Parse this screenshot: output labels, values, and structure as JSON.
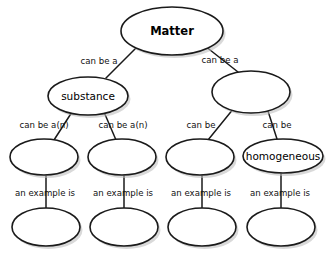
{
  "diagram": {
    "colors": {
      "background": "#ffffff",
      "node_fill": "#ffffff",
      "node_stroke": "#1a1a1a",
      "shadow": "#b9b9b9",
      "text": "#000000"
    },
    "nodes": [
      {
        "id": "matter",
        "label": "Matter",
        "cx": 172,
        "cy": 31,
        "rx": 51,
        "ry": 24,
        "bold": true
      },
      {
        "id": "substance",
        "label": "substance",
        "cx": 88,
        "cy": 96,
        "rx": 40,
        "ry": 19,
        "bold": false
      },
      {
        "id": "mixture",
        "label": "",
        "cx": 251,
        "cy": 92,
        "rx": 39,
        "ry": 21,
        "bold": false
      },
      {
        "id": "element",
        "label": "",
        "cx": 44,
        "cy": 157,
        "rx": 34,
        "ry": 18,
        "bold": false
      },
      {
        "id": "compound",
        "label": "",
        "cx": 122,
        "cy": 157,
        "rx": 34,
        "ry": 18,
        "bold": false
      },
      {
        "id": "heterog",
        "label": "",
        "cx": 200,
        "cy": 157,
        "rx": 34,
        "ry": 18,
        "bold": false
      },
      {
        "id": "homogeneous",
        "label": "homogeneous",
        "cx": 283,
        "cy": 156,
        "rx": 40,
        "ry": 17,
        "bold": false
      },
      {
        "id": "ex1",
        "label": "",
        "cx": 46,
        "cy": 227,
        "rx": 34,
        "ry": 19,
        "bold": false
      },
      {
        "id": "ex2",
        "label": "",
        "cx": 124,
        "cy": 227,
        "rx": 34,
        "ry": 19,
        "bold": false
      },
      {
        "id": "ex3",
        "label": "",
        "cx": 202,
        "cy": 227,
        "rx": 34,
        "ry": 19,
        "bold": false
      },
      {
        "id": "ex4",
        "label": "",
        "cx": 281,
        "cy": 227,
        "rx": 34,
        "ry": 19,
        "bold": false
      }
    ],
    "edges": [
      {
        "id": "e-matter-substance",
        "from": "matter",
        "to": "substance",
        "label": "can be a",
        "lx": 99,
        "ly": 61,
        "x1": 137,
        "y1": 47,
        "x2": 106,
        "y2": 78
      },
      {
        "id": "e-matter-mixture",
        "from": "matter",
        "to": "mixture",
        "label": "can be a",
        "lx": 220,
        "ly": 60,
        "x1": 205,
        "y1": 46,
        "x2": 238,
        "y2": 72
      },
      {
        "id": "e-substance-element",
        "from": "substance",
        "to": "element",
        "label": "can be a(n)",
        "lx": 44,
        "ly": 125,
        "x1": 72,
        "y1": 112,
        "x2": 54,
        "y2": 140
      },
      {
        "id": "e-substance-compound",
        "from": "substance",
        "to": "compound",
        "label": "can be a(n)",
        "lx": 123,
        "ly": 125,
        "x1": 104,
        "y1": 112,
        "x2": 116,
        "y2": 140
      },
      {
        "id": "e-mixture-heterog",
        "from": "mixture",
        "to": "heterog",
        "label": "can be",
        "lx": 201,
        "ly": 125,
        "x1": 234,
        "y1": 108,
        "x2": 208,
        "y2": 140
      },
      {
        "id": "e-mixture-homog",
        "from": "mixture",
        "to": "homogeneous",
        "label": "can be",
        "lx": 277,
        "ly": 125,
        "x1": 267,
        "y1": 108,
        "x2": 277,
        "y2": 139
      },
      {
        "id": "e-element-ex1",
        "from": "element",
        "to": "ex1",
        "label": "an example is",
        "lx": 45,
        "ly": 193,
        "x1": 46,
        "y1": 176,
        "x2": 46,
        "y2": 208
      },
      {
        "id": "e-compound-ex2",
        "from": "compound",
        "to": "ex2",
        "label": "an example is",
        "lx": 123,
        "ly": 193,
        "x1": 124,
        "y1": 176,
        "x2": 124,
        "y2": 208
      },
      {
        "id": "e-heterog-ex3",
        "from": "heterog",
        "to": "ex3",
        "label": "an example is",
        "lx": 201,
        "ly": 193,
        "x1": 202,
        "y1": 176,
        "x2": 202,
        "y2": 208
      },
      {
        "id": "e-homog-ex4",
        "from": "homogeneous",
        "to": "ex4",
        "label": "an example is",
        "lx": 280,
        "ly": 193,
        "x1": 281,
        "y1": 174,
        "x2": 281,
        "y2": 208
      }
    ]
  }
}
